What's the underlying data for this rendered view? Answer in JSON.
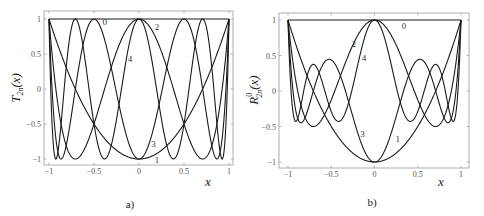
{
  "chart_data": [
    {
      "type": "line",
      "panel_caption": "a)",
      "title": "",
      "xlabel": "x",
      "ylabel": "T_2n(x)",
      "ylabel_main": "T",
      "ylabel_sub": "2n",
      "ylabel_tail": "(x)",
      "xlim": [
        -1,
        1
      ],
      "ylim": [
        -1,
        1
      ],
      "x_ticks": [
        -1,
        -0.5,
        0,
        0.5,
        1
      ],
      "x_tick_labels": [
        "−1",
        "−0.5",
        "0",
        "0.5",
        "1"
      ],
      "y_ticks": [
        -1,
        -0.5,
        0,
        0.5,
        1
      ],
      "y_tick_labels": [
        "−1",
        "−0.5",
        "0",
        "0.5",
        "1"
      ],
      "grid": false,
      "legend": "inline curve labels",
      "series": [
        {
          "name": "0",
          "label": "0",
          "formula": "T_0(x)=1",
          "coeffs_x2": [
            1
          ],
          "label_pos": [
            -0.38,
            0.96
          ]
        },
        {
          "name": "1",
          "label": "1",
          "formula": "T_2(x)=2x^2-1",
          "coeffs_x2": [
            -1,
            2
          ],
          "label_pos": [
            0.2,
            -1.02
          ]
        },
        {
          "name": "2",
          "label": "2",
          "formula": "T_4(x)=8x^4-8x^2+1",
          "coeffs_x2": [
            1,
            -8,
            8
          ],
          "label_pos": [
            0.2,
            0.88
          ]
        },
        {
          "name": "3",
          "label": "3",
          "formula": "T_6(x)=32x^6-48x^4+18x^2-1",
          "coeffs_x2": [
            -1,
            18,
            -48,
            32
          ],
          "label_pos": [
            0.16,
            -0.79
          ]
        },
        {
          "name": "4",
          "label": "4",
          "formula": "T_8(x)=128x^8-256x^6+160x^4-32x^2+1",
          "coeffs_x2": [
            1,
            -32,
            160,
            -256,
            128
          ],
          "label_pos": [
            -0.1,
            0.43
          ]
        }
      ]
    },
    {
      "type": "line",
      "panel_caption": "b)",
      "title": "",
      "xlabel": "x",
      "ylabel": "R^0_2n(x)",
      "ylabel_main": "R",
      "ylabel_sup": "0",
      "ylabel_sub": "2n",
      "ylabel_tail": "(x)",
      "xlim": [
        -1,
        1
      ],
      "ylim": [
        -1,
        1
      ],
      "x_ticks": [
        -1,
        -0.5,
        0,
        0.5,
        1
      ],
      "x_tick_labels": [
        "−1",
        "−0.5",
        "0",
        "0.5",
        "1"
      ],
      "y_ticks": [
        -1,
        -0.5,
        0,
        0.5,
        1
      ],
      "y_tick_labels": [
        "−1",
        "−0.5",
        "0",
        "0.5",
        "1"
      ],
      "grid": false,
      "legend": "inline curve labels",
      "series": [
        {
          "name": "0",
          "label": "0",
          "formula": "R_0^0(x)=1",
          "coeffs_x2": [
            1
          ],
          "label_pos": [
            0.34,
            0.92
          ]
        },
        {
          "name": "1",
          "label": "1",
          "formula": "R_2^0(x)=2x^2-1",
          "coeffs_x2": [
            -1,
            2
          ],
          "label_pos": [
            0.27,
            -0.68
          ]
        },
        {
          "name": "2",
          "label": "2",
          "formula": "R_4^0(x)=6x^4-6x^2+1",
          "coeffs_x2": [
            1,
            -6,
            6
          ],
          "label_pos": [
            -0.24,
            0.66
          ]
        },
        {
          "name": "3",
          "label": "3",
          "formula": "R_6^0(x)=20x^6-30x^4+12x^2-1",
          "coeffs_x2": [
            -1,
            12,
            -30,
            20
          ],
          "label_pos": [
            -0.14,
            -0.6
          ]
        },
        {
          "name": "4",
          "label": "4",
          "formula": "R_8^0(x)=70x^8-140x^6+90x^4-20x^2+1",
          "coeffs_x2": [
            1,
            -20,
            90,
            -140,
            70
          ],
          "label_pos": [
            -0.12,
            0.46
          ]
        }
      ]
    }
  ],
  "layout": {
    "panels": [
      {
        "frame": [
          44,
          11,
          233,
          165
        ],
        "plot": [
          49,
          19,
          229,
          159
        ],
        "caption_xy": [
          130,
          208
        ],
        "xlabel_xy": [
          208,
          186
        ],
        "ylabel_xy": [
          20,
          88
        ]
      },
      {
        "frame": [
          279,
          13,
          469,
          168
        ],
        "plot": [
          288,
          20,
          461,
          162
        ],
        "caption_xy": [
          372,
          206
        ],
        "xlabel_xy": [
          441,
          186
        ],
        "ylabel_xy": [
          258,
          90
        ]
      }
    ],
    "line_color": "#1a1a1a",
    "frame_color": "#9a9a9a"
  }
}
